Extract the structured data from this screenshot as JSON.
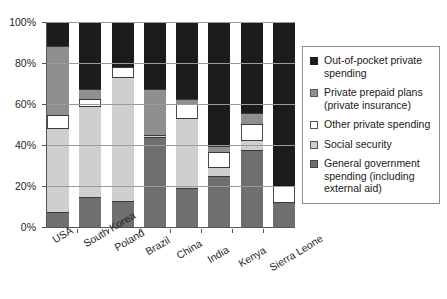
{
  "chart_data": {
    "type": "bar",
    "stacked": true,
    "title": "",
    "subtitle": "",
    "xlabel": "",
    "ylabel": "",
    "ylim": [
      0,
      100
    ],
    "y_unit": "%",
    "grid": true,
    "legend_position": "right",
    "yticks": [
      "0%",
      "20%",
      "40%",
      "60%",
      "80%",
      "100%"
    ],
    "ytick_values": [
      0,
      20,
      40,
      60,
      80,
      100
    ],
    "categories": [
      "USA",
      "South Korea",
      "Poland",
      "Brazil",
      "China",
      "India",
      "Kenya",
      "Sierra Leone"
    ],
    "series": [
      {
        "name": "General government spending (including external aid)",
        "color": "#6f6f6f",
        "values": [
          7,
          14,
          12,
          43.5,
          18.5,
          24.5,
          37,
          11.5
        ]
      },
      {
        "name": "Social security",
        "color": "#cfcfcf",
        "values": [
          41,
          44.5,
          60.5,
          1,
          34,
          4.5,
          5,
          0
        ]
      },
      {
        "name": "Other private spending",
        "color": "#ffffff",
        "values": [
          6,
          3.5,
          5,
          0,
          7,
          7,
          8,
          8
        ]
      },
      {
        "name": "Private prepaid plans (private insurance)",
        "color": "#8f8f8f",
        "values": [
          34,
          5,
          0,
          22.5,
          2.5,
          3,
          5,
          0
        ]
      },
      {
        "name": "Out-of-pocket private spending",
        "color": "#1c1c1c",
        "values": [
          12,
          33,
          22.5,
          33,
          38,
          61,
          45,
          80.5
        ]
      }
    ]
  },
  "legend": {
    "items": [
      {
        "label": "Out-of-pocket private spending",
        "swatch": "oop",
        "icon": "legend-swatch-black"
      },
      {
        "label": "Private prepaid plans (private insurance)",
        "swatch": "prepaid",
        "icon": "legend-swatch-medium-gray"
      },
      {
        "label": "Other private spending",
        "swatch": "other",
        "icon": "legend-swatch-white"
      },
      {
        "label": "Social security",
        "swatch": "social",
        "icon": "legend-swatch-light-gray"
      },
      {
        "label": "General government spending (including external aid)",
        "swatch": "gov",
        "icon": "legend-swatch-dark-gray"
      }
    ]
  }
}
